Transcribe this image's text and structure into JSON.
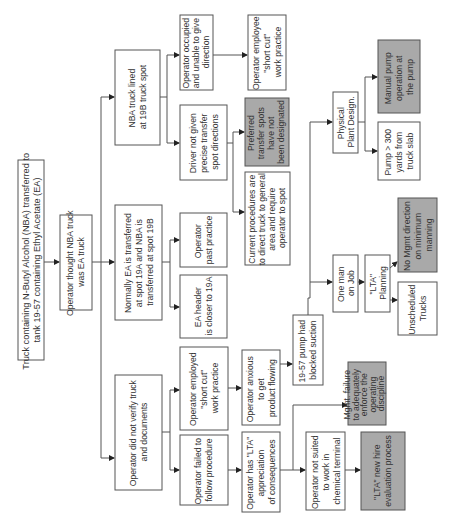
{
  "diagram": {
    "type": "fault-tree / cause-and-effect",
    "orientation": "rotated 90 degrees counter-clockwise",
    "colors": {
      "box_fill": "#ffffff",
      "shaded_fill": "#a9a9a9",
      "stroke": "#555555",
      "text": "#333333"
    },
    "nodes": {
      "root": {
        "lines": [
          "Truck containing N-Butyl Alcohol  (NBA) transferred to",
          "tank 19-57 containing Ethyl Acetate (EA)"
        ],
        "shaded": false
      },
      "thought": {
        "lines": [
          "Operator thought NBA truck",
          "was EA truck"
        ],
        "shaded": false
      },
      "nba_lined": {
        "lines": [
          "NBA truck lined",
          "at 19B truck spot"
        ],
        "shaded": false
      },
      "normally": {
        "lines": [
          "Normally EA is transferred",
          "at spot 19A and NBA is",
          "transferred at spot 19B"
        ],
        "shaded": false
      },
      "not_verify": {
        "lines": [
          "Operator did not verify truck",
          "and documents"
        ],
        "shaded": false
      },
      "occupied": {
        "lines": [
          "Operator occupied",
          "and unable to give",
          "direction"
        ],
        "shaded": false
      },
      "driver_not": {
        "lines": [
          "Driver not given",
          "precise transfer",
          "spot directions"
        ],
        "shaded": false
      },
      "employee_short": {
        "lines": [
          "Operator employee",
          "\"short cut\"",
          "work practice"
        ],
        "shaded": false
      },
      "preferred": {
        "lines": [
          "Preferred",
          "transfer spots",
          "have not",
          "been designated"
        ],
        "shaded": true
      },
      "current_proc": {
        "lines": [
          "Current procedures are",
          "to direct truck to general",
          "area and require",
          "operator to spot"
        ],
        "shaded": false
      },
      "past_practice": {
        "lines": [
          "Operator",
          "past  practice"
        ],
        "shaded": false
      },
      "ea_header": {
        "lines": [
          "EA header",
          "is closer to 19A"
        ],
        "shaded": false
      },
      "employed_short": {
        "lines": [
          "Operator employed",
          "\"short cut\"",
          "work practice"
        ],
        "shaded": false
      },
      "failed_follow": {
        "lines": [
          "Operator failed to",
          "follow procedure"
        ],
        "shaded": false
      },
      "anxious": {
        "lines": [
          "Operator anxious",
          "to get",
          "product flowing"
        ],
        "shaded": false
      },
      "lta_appreciation": {
        "lines": [
          "Operator has \"LTA\"",
          "appreciation",
          "of consequences"
        ],
        "shaded": false
      },
      "pump_blocked": {
        "lines": [
          "19-57 pump had",
          "blocked suction"
        ],
        "shaded": false
      },
      "not_suited": {
        "lines": [
          "Operator not suited",
          "to work in",
          "chemical terminal"
        ],
        "shaded": false
      },
      "mgmt_failure": {
        "lines": [
          "Mgmt. failure",
          "to adequately",
          "enforce the",
          "operating",
          "discipline"
        ],
        "shaded": true
      },
      "lta_new_hire": {
        "lines": [
          "\"LTA\" new hire",
          "evaluation process"
        ],
        "shaded": true
      },
      "physical": {
        "lines": [
          "Physical",
          "Plant Design."
        ],
        "shaded": false
      },
      "manual_pump": {
        "lines": [
          "Manual pump",
          "operation at",
          "the pump"
        ],
        "shaded": true
      },
      "pump_300": {
        "lines": [
          "Pump > 300",
          "yards from",
          "truck slab"
        ],
        "shaded": false
      },
      "one_man": {
        "lines": [
          "One man",
          "on Job"
        ],
        "shaded": false
      },
      "lta_planning": {
        "lines": [
          "\"LTA\"",
          "Planning"
        ],
        "shaded": false
      },
      "no_mgmt": {
        "lines": [
          "No Mgmt direction",
          "on minimum",
          "manning"
        ],
        "shaded": true
      },
      "unscheduled": {
        "lines": [
          "Unscheduled",
          "Trucks"
        ],
        "shaded": false
      }
    }
  }
}
